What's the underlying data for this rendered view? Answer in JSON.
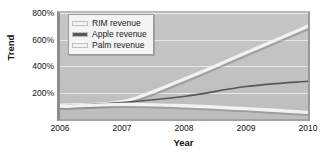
{
  "chart_data": {
    "type": "line",
    "title": "",
    "xlabel": "Year",
    "ylabel": "Trend",
    "x": [
      2006,
      2007,
      2008,
      2009,
      2010
    ],
    "xlim": [
      2006,
      2010
    ],
    "ylim": [
      0,
      800
    ],
    "xtick_labels": [
      "2006",
      "2007",
      "2008",
      "2009",
      "2010"
    ],
    "ytick_labels": [
      "200%",
      "400%",
      "600%",
      "800%"
    ],
    "ytick_values": [
      200,
      400,
      600,
      800
    ],
    "grid": "horizontal",
    "legend_position": "upper-left",
    "series": [
      {
        "name": "RIM revenue",
        "label": "RIM revenue",
        "color": "#f2f2f2",
        "values": [
          105,
          130,
          300,
          500,
          700
        ]
      },
      {
        "name": "Apple revenue",
        "label": "Apple revenue",
        "color": "#575757",
        "values": [
          100,
          125,
          170,
          245,
          285
        ]
      },
      {
        "name": "Palm revenue",
        "label": "Palm revenue",
        "color": "#f2f2f2",
        "values": [
          95,
          110,
          100,
          78,
          50
        ]
      }
    ]
  },
  "figure": {
    "background_color": "#ffffff",
    "plot_background_color": "#c3c3c3",
    "gridline_color": "#eeeeee"
  }
}
